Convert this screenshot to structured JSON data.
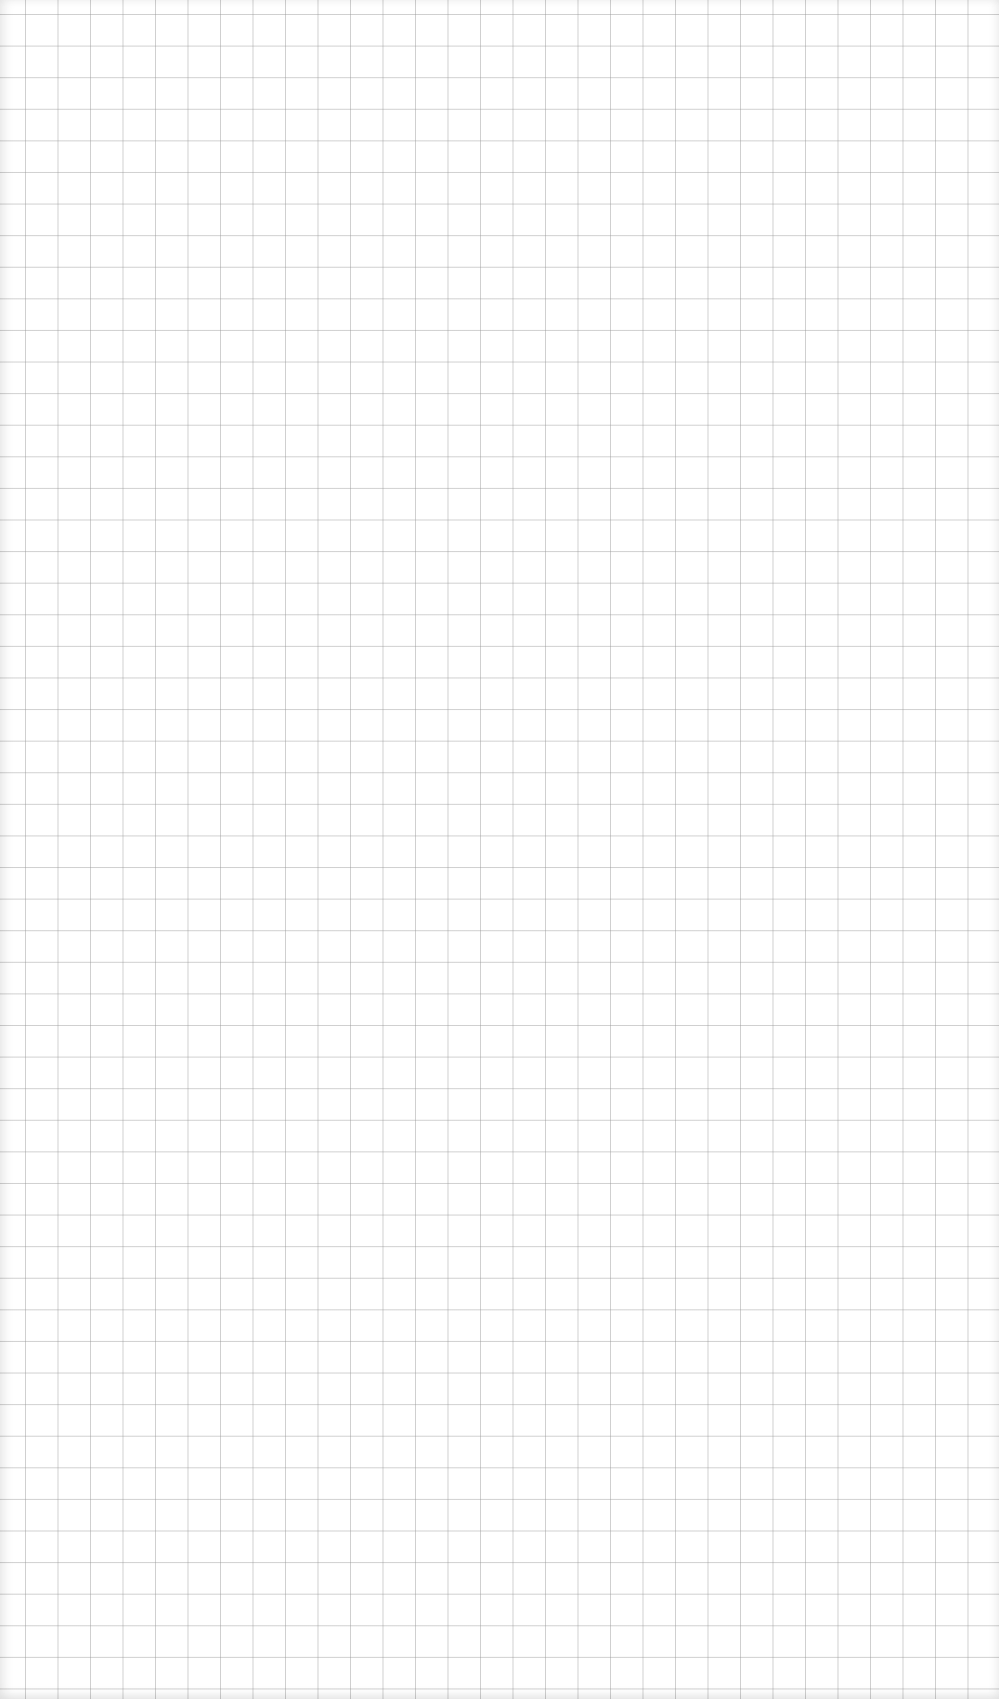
{
  "page": {
    "type": "graph-paper",
    "content": "",
    "grid": {
      "columns": 30,
      "rows": 53,
      "line_color": "#c8c8c8",
      "background": "#ffffff"
    }
  }
}
